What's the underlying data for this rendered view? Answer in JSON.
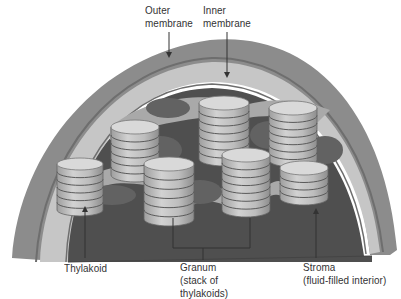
{
  "diagram": {
    "colors": {
      "outer_membrane": "#8a8a8a",
      "membrane_stripe": "#6e6e6e",
      "intermembrane": "#c4c4c4",
      "stroma": "#4f4f4f",
      "lamella_blob": "#626262",
      "stroma_light": "#a9a9a9",
      "cylinder_side": "#bdbdbd",
      "cylinder_top": "#d9d9d9",
      "disk_line": "#5a5a5a",
      "leader_line": "#333333",
      "text": "#333333"
    },
    "labels": {
      "outer_membrane": {
        "line1": "Outer",
        "line2": "membrane"
      },
      "inner_membrane": {
        "line1": "Inner",
        "line2": "membrane"
      },
      "thylakoid": {
        "line1": "Thylakoid"
      },
      "granum": {
        "line1": "Granum",
        "line2": "(stack of",
        "line3": "thylakoids)"
      },
      "stroma": {
        "line1": "Stroma",
        "line2": "(fluid-filled interior)"
      }
    },
    "grana": [
      {
        "name": "granum-top-center",
        "cx": 224,
        "top": 96,
        "rx": 25,
        "ry": 7,
        "disks": 7,
        "h": 56
      },
      {
        "name": "granum-top-right",
        "cx": 293,
        "top": 101,
        "rx": 24,
        "ry": 7,
        "disks": 7,
        "h": 52
      },
      {
        "name": "granum-mid-left",
        "cx": 135,
        "top": 120,
        "rx": 24,
        "ry": 7,
        "disks": 6,
        "h": 48
      },
      {
        "name": "granum-far-left",
        "cx": 80,
        "top": 158,
        "rx": 23,
        "ry": 6,
        "disks": 6,
        "h": 46
      },
      {
        "name": "granum-center-front",
        "cx": 169,
        "top": 157,
        "rx": 25,
        "ry": 7,
        "disks": 6,
        "h": 55
      },
      {
        "name": "granum-center-right",
        "cx": 246,
        "top": 148,
        "rx": 24,
        "ry": 7,
        "disks": 7,
        "h": 55
      },
      {
        "name": "granum-right-short",
        "cx": 304,
        "top": 161,
        "rx": 24,
        "ry": 7,
        "disks": 4,
        "h": 30
      }
    ]
  }
}
